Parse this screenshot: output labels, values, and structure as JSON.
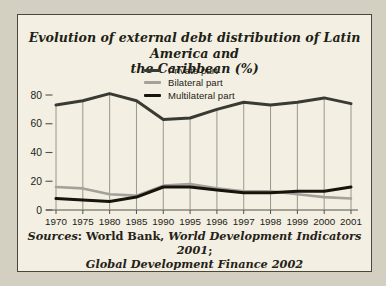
{
  "figure": {
    "title": {
      "line1": "Evolution of external debt distribution of Latin America and",
      "line2": "the Caribbean (%)"
    },
    "sources": {
      "label_italic": "Sources",
      "publisher_regular": ": World Bank, ",
      "work1_italic": "World Development Indicators 2001",
      "semicolon": ";",
      "work2_italic": "Global Development Finance 2002"
    }
  },
  "chart_data": {
    "type": "line",
    "title": "Evolution of external debt distribution of Latin America and the Caribbean (%)",
    "categories": [
      "1970",
      "1975",
      "1980",
      "1985",
      "1990",
      "1995",
      "1996",
      "1997",
      "1998",
      "1999",
      "2000",
      "2001"
    ],
    "series": [
      {
        "name": "Private part",
        "values": [
          73,
          76,
          81,
          76,
          63,
          64,
          70,
          75,
          73,
          75,
          78,
          74
        ],
        "color": "#3a3a35",
        "width": 3
      },
      {
        "name": "Bilateral part",
        "values": [
          16,
          15,
          11,
          10,
          17,
          18,
          15,
          13,
          13,
          11,
          9,
          8
        ],
        "color": "#a3a199",
        "width": 2.6
      },
      {
        "name": "Multilateral part",
        "values": [
          8,
          7,
          6,
          9,
          16,
          16,
          14,
          12,
          12,
          13,
          13,
          16
        ],
        "color": "#17130d",
        "width": 3
      }
    ],
    "xlabel": "",
    "ylabel": "",
    "ylim": [
      0,
      80
    ],
    "yticks": [
      0,
      20,
      40,
      60,
      80
    ],
    "grid": "vertical droplines up to top series",
    "legend_position": "top-center inside plot",
    "style": {
      "axis_color": "#545147",
      "grid_color": "#8f8d80",
      "tick_text_color": "#1d1b15",
      "plot_bg": "#f3f0e3",
      "page_bg": "#d3d0c1",
      "border_color": "#49473d"
    }
  }
}
